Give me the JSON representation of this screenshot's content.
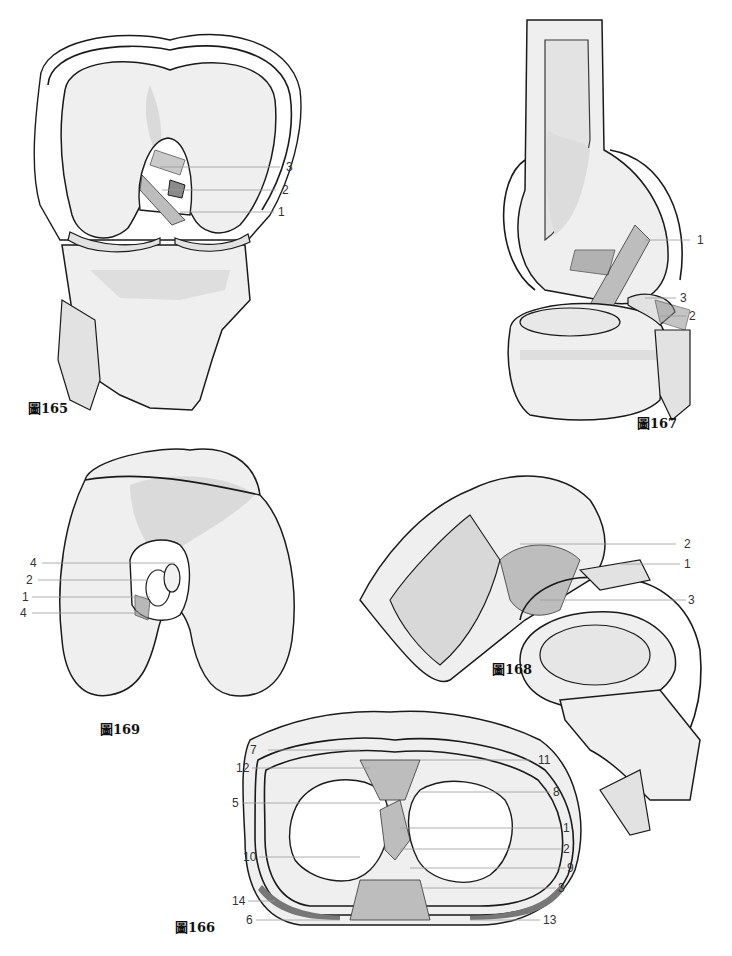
{
  "figures": {
    "fig165": {
      "caption": "圖165",
      "labels": [
        "3",
        "2",
        "1"
      ]
    },
    "fig167": {
      "caption": "圖167",
      "labels": [
        "1",
        "3",
        "2"
      ]
    },
    "fig169": {
      "caption": "圖169",
      "labels": [
        "4",
        "2",
        "1",
        "4"
      ]
    },
    "fig168": {
      "caption": "圖168",
      "labels": [
        "2",
        "1",
        "3"
      ]
    },
    "fig166": {
      "caption": "圖166",
      "labels_left": [
        "7",
        "12",
        "5",
        "10",
        "14",
        "6"
      ],
      "labels_right": [
        "11",
        "8",
        "1",
        "2",
        "9",
        "3",
        "13"
      ]
    }
  },
  "colors": {
    "outline": "#1a1a1a",
    "bone_fill": "#efefef",
    "shade": "#d2d2d2",
    "ligament": "#bdbdbd",
    "leader_line": "#9a9a9a"
  }
}
